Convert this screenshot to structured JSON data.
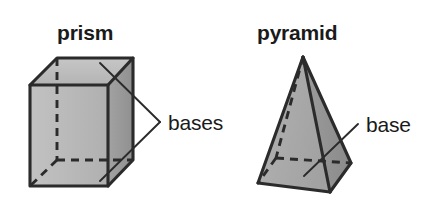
{
  "diagram": {
    "background_color": "#ffffff",
    "line_color": "#2b2b2b",
    "text_color": "#1a1a1a"
  },
  "figures": [
    {
      "id": "prism",
      "title": "prism",
      "callout": "bases",
      "callout_count": 2,
      "fill_front": "#b8b8b8",
      "fill_side": "#9a9a9a",
      "fill_top": "#bdbdbd"
    },
    {
      "id": "pyramid",
      "title": "pyramid",
      "callout": "base",
      "callout_count": 1,
      "fill_left": "#ababab",
      "fill_right": "#929292",
      "fill_base": "#a0a0a0"
    }
  ],
  "labels": {
    "prism_title": "prism",
    "pyramid_title": "pyramid",
    "prism_callout": "bases",
    "pyramid_callout": "base"
  },
  "icons": {
    "prism_shape": "rectangular-prism-icon",
    "pyramid_shape": "square-pyramid-icon"
  }
}
